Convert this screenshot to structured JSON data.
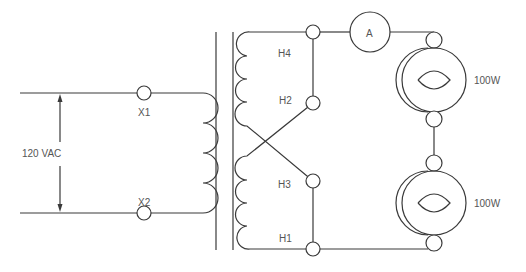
{
  "diagram": {
    "type": "transformer-circuit",
    "source_voltage_label": "120 VAC",
    "secondary_terminals": [
      "X1",
      "X2"
    ],
    "primary_terminals": [
      "H4",
      "H2",
      "H3",
      "H1"
    ],
    "meter_label": "A",
    "lamps": [
      {
        "label": "100W"
      },
      {
        "label": "100W"
      }
    ],
    "colors": {
      "line": "#3a3a3a",
      "text": "#555555",
      "background": "#ffffff"
    }
  }
}
